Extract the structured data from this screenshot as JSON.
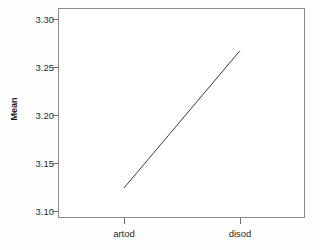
{
  "chart_data": {
    "type": "line",
    "title": "",
    "subtitle": "",
    "xlabel": "",
    "ylabel": "Mean",
    "categories": [
      "artod",
      "disod"
    ],
    "values": [
      3.124,
      3.267
    ],
    "series": [
      {
        "name": "Mean",
        "values": [
          3.124,
          3.267
        ]
      }
    ],
    "yticks": [
      "3.30",
      "3.25",
      "3.20",
      "3.15",
      "3.10"
    ],
    "ytick_values": [
      3.3,
      3.25,
      3.2,
      3.15,
      3.1
    ],
    "ylim": [
      3.087,
      3.313
    ],
    "xlim": [
      0,
      1
    ],
    "grid": false,
    "legend": false,
    "legend_position": "none",
    "line_color": "#3a3a3a",
    "frame_color": "#8c8c8c",
    "background": "#ffffff"
  },
  "axes": {
    "y_label": "Mean",
    "y_ticks": [
      {
        "label": "3.30",
        "value": 3.3
      },
      {
        "label": "3.25",
        "value": 3.25
      },
      {
        "label": "3.20",
        "value": 3.2
      },
      {
        "label": "3.15",
        "value": 3.15
      },
      {
        "label": "3.10",
        "value": 3.1
      }
    ],
    "x_ticks": [
      {
        "label": "artod",
        "value": 3.124
      },
      {
        "label": "disod",
        "value": 3.267
      }
    ]
  }
}
